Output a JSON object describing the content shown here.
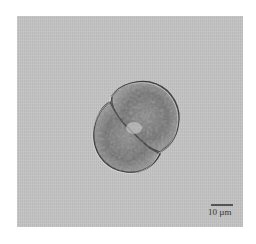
{
  "image": {
    "subject": "micrograph of a two-lobed (desmid) algal cell",
    "background_color": "#c4c4c4"
  },
  "scale_bar": {
    "label": "10 µm"
  }
}
